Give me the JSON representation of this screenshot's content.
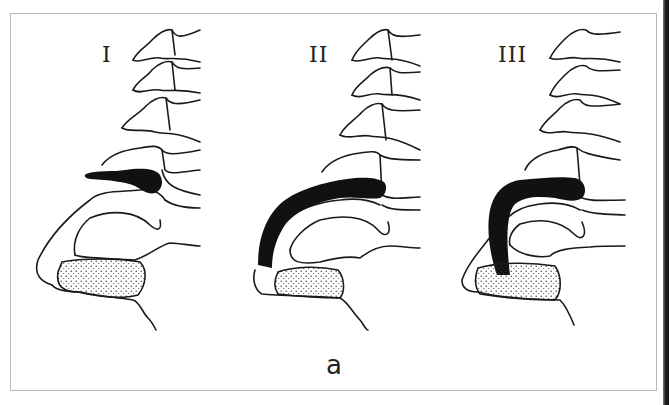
{
  "figure": {
    "caption": "a",
    "panels": [
      {
        "label": "I",
        "description": "short horizontal dark band anterior to C2/C3 level"
      },
      {
        "label": "II",
        "description": "curved dark band extending from upper cervical spine down anterior to the mandible"
      },
      {
        "label": "III",
        "description": "C-shaped dark band reaching down to the hyoid/dotted region"
      }
    ],
    "colors": {
      "ink": "#111111",
      "border": "#b8b8b8",
      "background": "#ffffff"
    }
  }
}
